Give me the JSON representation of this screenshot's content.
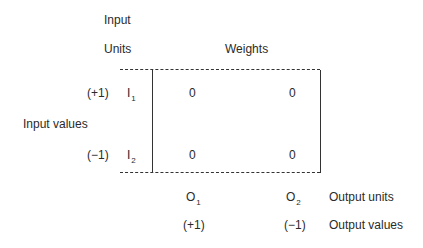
{
  "headers": {
    "input_units_line1": "Input",
    "input_units_line2": "Units",
    "weights": "Weights",
    "input_values": "Input values",
    "output_units": "Output units",
    "output_values": "Output values"
  },
  "inputs": [
    {
      "value": "(+1)",
      "label": "I",
      "sub": "1",
      "weights": [
        "0",
        "0"
      ]
    },
    {
      "value": "(−1)",
      "label": "I",
      "sub": "2",
      "weights": [
        "0",
        "0"
      ]
    }
  ],
  "outputs": [
    {
      "label": "O",
      "sub": "1",
      "value": "(+1)"
    },
    {
      "label": "O",
      "sub": "2",
      "value": "(−1)"
    }
  ]
}
